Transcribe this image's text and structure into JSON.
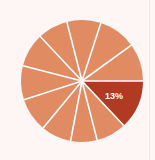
{
  "canvas": {
    "width": 155,
    "height": 160,
    "background_color": "#fdf6f4"
  },
  "chart_data": {
    "type": "pie",
    "title": "",
    "subtitle": "",
    "xlabel": "",
    "ylabel": "",
    "grid": false,
    "legend_position": "none",
    "center": {
      "x": 82,
      "y": 81
    },
    "radius": 61,
    "start_angle_deg": 0,
    "direction": "clockwise",
    "divider_color": "#ffffff",
    "divider_width": 1.6,
    "default_slice_color": "#e08b62",
    "highlight_slice_color": "#b03a22",
    "labels": [
      "",
      "",
      "",
      "",
      "",
      "",
      "",
      "",
      "",
      "",
      ""
    ],
    "values": [
      13,
      8,
      7,
      8,
      9,
      9,
      9,
      8,
      9,
      10,
      10
    ],
    "colors": [
      "#b03a22",
      "#e08b62",
      "#e08b62",
      "#e08b62",
      "#e08b62",
      "#e08b62",
      "#e08b62",
      "#e08b62",
      "#e08b62",
      "#e08b62",
      "#e08b62"
    ],
    "annotations": [
      {
        "text": "13%",
        "slice_index": 0,
        "x": 114,
        "y": 99,
        "color": "#ffffff"
      }
    ]
  }
}
